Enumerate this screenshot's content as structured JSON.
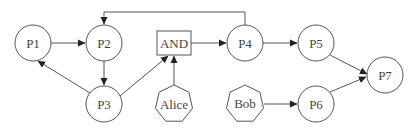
{
  "diagram": {
    "type": "petri-net-like flow graph",
    "nodes": [
      {
        "id": "P1",
        "label": "P1",
        "shape": "circle"
      },
      {
        "id": "P2",
        "label": "P2",
        "shape": "circle"
      },
      {
        "id": "P3",
        "label": "P3",
        "shape": "circle"
      },
      {
        "id": "AND",
        "label": "AND",
        "shape": "rectangle"
      },
      {
        "id": "Alice",
        "label": "Alice",
        "shape": "heptagon"
      },
      {
        "id": "P4",
        "label": "P4",
        "shape": "circle"
      },
      {
        "id": "P5",
        "label": "P5",
        "shape": "circle"
      },
      {
        "id": "Bob",
        "label": "Bob",
        "shape": "heptagon"
      },
      {
        "id": "P6",
        "label": "P6",
        "shape": "circle"
      },
      {
        "id": "P7",
        "label": "P7",
        "shape": "circle"
      }
    ],
    "edges": [
      {
        "from": "P1",
        "to": "P2"
      },
      {
        "from": "P2",
        "to": "P3"
      },
      {
        "from": "P3",
        "to": "P1"
      },
      {
        "from": "P3",
        "to": "AND"
      },
      {
        "from": "Alice",
        "to": "AND"
      },
      {
        "from": "AND",
        "to": "P4"
      },
      {
        "from": "P4",
        "to": "P2",
        "routing": "orthogonal over top"
      },
      {
        "from": "P4",
        "to": "P5"
      },
      {
        "from": "P5",
        "to": "P7"
      },
      {
        "from": "Bob",
        "to": "P6"
      },
      {
        "from": "P6",
        "to": "P7"
      }
    ]
  }
}
